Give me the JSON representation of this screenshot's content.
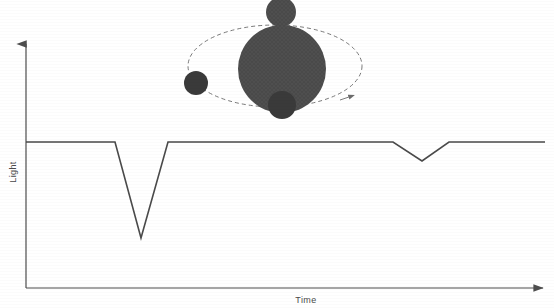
{
  "figure": {
    "title": "",
    "background_color": "#ffffff",
    "line_color": "#4a4a4a",
    "body_color": "#4a4a4a",
    "orbit_color": "#6b6b6b",
    "axis_color": "#4d4d4d"
  },
  "axes": {
    "y_label": "Light",
    "x_label": "Time",
    "y_axis": {
      "x": 26,
      "y_top": 42,
      "y_bottom": 288,
      "arrow": "up-arrow"
    },
    "x_axis": {
      "y": 288,
      "x_left": 26,
      "x_right": 545,
      "arrow": "right-arrow"
    }
  },
  "chart_data": {
    "type": "line",
    "title": "",
    "xlabel": "Time",
    "ylabel": "Light",
    "grid": false,
    "legend": "none",
    "xlim": [
      0,
      1
    ],
    "ylim": [
      0,
      1
    ],
    "series": [
      {
        "name": "Light curve",
        "description": "Stellar brightness over time showing two transit dips: a deep primary eclipse and a shallow secondary eclipse",
        "points_px": [
          [
            26,
            142
          ],
          [
            115,
            142
          ],
          [
            141,
            238
          ],
          [
            168,
            142
          ],
          [
            393,
            142
          ],
          [
            422,
            161
          ],
          [
            449,
            142
          ],
          [
            545,
            142
          ]
        ],
        "x_normalized": [
          0.0,
          0.171,
          0.222,
          0.274,
          0.707,
          0.763,
          0.815,
          1.0
        ],
        "y_normalized": [
          1.0,
          1.0,
          0.342,
          1.0,
          1.0,
          0.87,
          1.0,
          1.0
        ]
      }
    ],
    "annotations": [
      {
        "name": "primary-eclipse",
        "label": "deep dip",
        "x_px": 141,
        "y_px": 238,
        "depth": 0.658
      },
      {
        "name": "secondary-eclipse",
        "label": "shallow dip",
        "x_px": 422,
        "y_px": 161,
        "depth": 0.13
      },
      {
        "name": "baseline",
        "label": "out-of-transit flux",
        "y_px": 142,
        "value": 1.0
      }
    ]
  },
  "orbit_diagram": {
    "name": "transit-schematic",
    "star": {
      "name": "star",
      "cx": 282,
      "cy": 69,
      "r": 44
    },
    "orbit": {
      "name": "orbit-ellipse",
      "cx": 275,
      "cy": 66,
      "rx": 87,
      "ry": 41,
      "style": "dashed",
      "direction_arrow": {
        "x": 348,
        "y": 95,
        "angle_deg": 20
      }
    },
    "planets": [
      {
        "name": "planet-top",
        "cx": 281,
        "cy": 12,
        "r": 15,
        "position_label": "top"
      },
      {
        "name": "planet-bottom",
        "cx": 282,
        "cy": 105,
        "r": 14,
        "position_label": "bottom"
      },
      {
        "name": "planet-left",
        "cx": 196,
        "cy": 83,
        "r": 12,
        "position_label": "left"
      }
    ]
  }
}
